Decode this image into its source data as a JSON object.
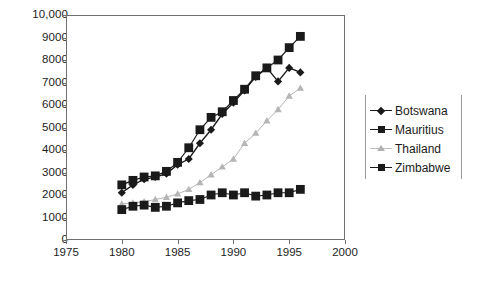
{
  "chart_data": {
    "type": "line",
    "title": "",
    "xlabel": "",
    "ylabel": "",
    "xlim": [
      1975,
      2000
    ],
    "ylim": [
      0,
      10000
    ],
    "grid": false,
    "legend_position": "right",
    "x": [
      1980,
      1981,
      1982,
      1983,
      1984,
      1985,
      1986,
      1987,
      1988,
      1989,
      1990,
      1991,
      1992,
      1993,
      1994,
      1995,
      1996
    ],
    "xticks": [
      "1975",
      "1980",
      "1985",
      "1990",
      "1995",
      "2000"
    ],
    "xtick_values": [
      1975,
      1980,
      1985,
      1990,
      1995,
      2000
    ],
    "yticks": [
      "0",
      "1000",
      "2000",
      "3000",
      "4000",
      "5000",
      "6000",
      "7000",
      "8000",
      "9000",
      "10,000"
    ],
    "ytick_values": [
      0,
      1000,
      2000,
      3000,
      4000,
      5000,
      6000,
      7000,
      8000,
      9000,
      10000
    ],
    "series": [
      {
        "name": "Botswana",
        "marker": "diamond",
        "color": "#1a1a1a",
        "values": [
          2100,
          2450,
          2700,
          2800,
          2950,
          3350,
          3600,
          4300,
          4900,
          5600,
          6100,
          6650,
          7250,
          7650,
          7050,
          7650,
          7450
        ]
      },
      {
        "name": "Mauritius",
        "marker": "square",
        "color": "#1a1a1a",
        "values": [
          2450,
          2650,
          2800,
          2850,
          3050,
          3450,
          4100,
          4900,
          5450,
          5700,
          6200,
          6700,
          7300,
          7650,
          8000,
          8550,
          9050
        ]
      },
      {
        "name": "Thailand",
        "marker": "triangle",
        "color": "#b5b5b5",
        "values": [
          1600,
          1650,
          1700,
          1800,
          1900,
          2050,
          2250,
          2550,
          2900,
          3250,
          3600,
          4300,
          4750,
          5300,
          5800,
          6400,
          6750
        ]
      },
      {
        "name": "Zimbabwe",
        "marker": "square",
        "color": "#1a1a1a",
        "values": [
          1350,
          1500,
          1550,
          1450,
          1500,
          1650,
          1750,
          1800,
          2000,
          2100,
          2000,
          2100,
          1950,
          2000,
          2100,
          2100,
          2250
        ]
      }
    ]
  },
  "legend": {
    "items": [
      {
        "label": "Botswana"
      },
      {
        "label": "Mauritius"
      },
      {
        "label": "Thailand"
      },
      {
        "label": "Zimbabwe"
      }
    ]
  }
}
